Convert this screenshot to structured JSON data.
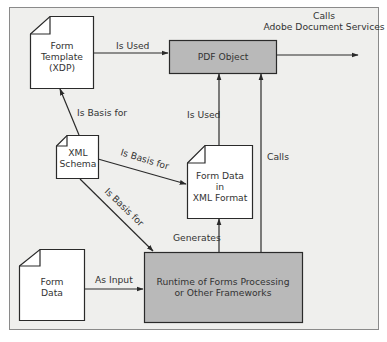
{
  "diagram": {
    "colors": {
      "frame_bg": "#efefed",
      "frame_border": "#8a8a8a",
      "doc_fill": "#ffffff",
      "box_fill": "#b9b9b9",
      "stroke": "#2a2a2a",
      "text": "#333333"
    },
    "nodes": {
      "form_template": {
        "lines": [
          "Form",
          "Template",
          "(XDP)"
        ],
        "shape": "document"
      },
      "pdf_object": {
        "lines": [
          "PDF Object"
        ],
        "shape": "box"
      },
      "xml_schema": {
        "lines": [
          "XML",
          "Schema"
        ],
        "shape": "document"
      },
      "form_data_xml": {
        "lines": [
          "Form Data",
          "in",
          "XML Format"
        ],
        "shape": "document"
      },
      "form_data": {
        "lines": [
          "Form",
          "Data"
        ],
        "shape": "document"
      },
      "runtime": {
        "lines": [
          "Runtime of Forms Processing",
          "or Other Frameworks"
        ],
        "shape": "box"
      }
    },
    "edges": {
      "template_to_pdf": {
        "from": "Form Template (XDP)",
        "to": "PDF Object",
        "label": "Is Used"
      },
      "pdf_to_ads": {
        "from": "PDF Object",
        "to": "external",
        "label_lines": [
          "Calls",
          "Adobe Document Services"
        ]
      },
      "schema_to_template": {
        "from": "XML Schema",
        "to": "Form Template (XDP)",
        "label": "Is Basis for"
      },
      "schema_to_formdata": {
        "from": "XML Schema",
        "to": "Form Data in XML Format",
        "label": "Is Basis for"
      },
      "schema_to_runtime": {
        "from": "XML Schema",
        "to": "Runtime of Forms Processing or Other Frameworks",
        "label": "Is Basis for"
      },
      "formdata_xml_to_pdf": {
        "from": "Form Data in XML Format",
        "to": "PDF Object",
        "label": "Is Used"
      },
      "runtime_to_pdf": {
        "from": "Runtime of Forms Processing or Other Frameworks",
        "to": "PDF Object",
        "label": "Calls"
      },
      "runtime_to_formdata_xml": {
        "from": "Runtime of Forms Processing or Other Frameworks",
        "to": "Form Data in XML Format",
        "label": "Generates"
      },
      "formdata_to_runtime": {
        "from": "Form Data",
        "to": "Runtime of Forms Processing or Other Frameworks",
        "label": "As Input"
      }
    }
  }
}
